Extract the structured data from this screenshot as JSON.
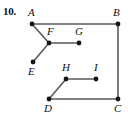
{
  "figure": {
    "problem_number": "10.",
    "width": 128,
    "height": 119,
    "background_color": "#ffffff",
    "line_color": "#5a5a5a",
    "dot_color": "#151515",
    "label_color": "#111111",
    "vertices": [
      {
        "id": "A",
        "label": "A",
        "x": 32,
        "y": 24,
        "label_x": 28,
        "label_y": 16
      },
      {
        "id": "B",
        "label": "B",
        "x": 118,
        "y": 24,
        "label_x": 113,
        "label_y": 16
      },
      {
        "id": "C",
        "label": "C",
        "x": 118,
        "y": 99,
        "label_x": 114,
        "label_y": 112
      },
      {
        "id": "D",
        "label": "D",
        "x": 49,
        "y": 99,
        "label_x": 44,
        "label_y": 112
      },
      {
        "id": "E",
        "label": "E",
        "x": 33,
        "y": 62,
        "label_x": 28,
        "label_y": 75
      },
      {
        "id": "F",
        "label": "F",
        "x": 49,
        "y": 43,
        "label_x": 47,
        "label_y": 35
      },
      {
        "id": "G",
        "label": "G",
        "x": 79,
        "y": 43,
        "label_x": 75,
        "label_y": 35
      },
      {
        "id": "H",
        "label": "H",
        "x": 66,
        "y": 79,
        "label_x": 62,
        "label_y": 71
      },
      {
        "id": "I",
        "label": "I",
        "x": 96,
        "y": 79,
        "label_x": 94,
        "label_y": 71
      }
    ],
    "edges": [
      {
        "name": "edge-A-B",
        "from": "A",
        "to": "B"
      },
      {
        "name": "edge-B-C",
        "from": "B",
        "to": "C"
      },
      {
        "name": "edge-C-D",
        "from": "C",
        "to": "D"
      },
      {
        "name": "edge-A-F",
        "from": "A",
        "to": "F"
      },
      {
        "name": "edge-F-E",
        "from": "F",
        "to": "E"
      },
      {
        "name": "edge-F-G",
        "from": "F",
        "to": "G"
      },
      {
        "name": "edge-D-H",
        "from": "D",
        "to": "H"
      },
      {
        "name": "edge-H-I",
        "from": "H",
        "to": "I"
      }
    ]
  }
}
